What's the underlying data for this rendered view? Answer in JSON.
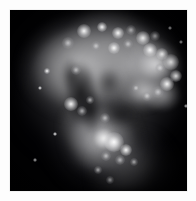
{
  "page": {
    "background_color": "#fdfdfd",
    "width": 196,
    "height": 201,
    "caption": ""
  },
  "plate": {
    "name": "colliding-galaxies-grayscale-plate",
    "alt_text": "Grayscale astronomical image of a pair of colliding interacting galaxies",
    "frame": {
      "left": 10,
      "top": 10,
      "width": 177,
      "height": 181
    },
    "background_color": "#010103",
    "colors": {
      "sky_background": "#010103",
      "faint_halo": "#5a5a5d",
      "mid_nebulosity": "#96969a",
      "bright_body": "#c4c4c6",
      "brightest_knot": "#fafafa",
      "dust_lane": "#040406",
      "page_white": "#fdfdfd"
    },
    "regions": [
      {
        "label": "northern-galaxy-body",
        "description": "large bright lobe filling the upper half"
      },
      {
        "label": "northern-galaxy-arc",
        "description": "bright rim of knots along the upper-right edge"
      },
      {
        "label": "dust-lane",
        "description": "dark absorbing lane through the centre-left"
      },
      {
        "label": "southern-galaxy-body",
        "description": "lower lobe with a compact bright nucleus"
      },
      {
        "label": "southern-tidal-tail",
        "description": "faint plume sweeping toward the lower right"
      },
      {
        "label": "vignette",
        "description": "deep black sky in the corners"
      }
    ],
    "knots": [
      {
        "x": 74,
        "y": 21,
        "r": 3.0,
        "bright": true
      },
      {
        "x": 92,
        "y": 17,
        "r": 2.4,
        "bright": true
      },
      {
        "x": 108,
        "y": 23,
        "r": 2.6,
        "bright": true
      },
      {
        "x": 121,
        "y": 20,
        "r": 2.2,
        "bright": false
      },
      {
        "x": 133,
        "y": 28,
        "r": 3.2,
        "bright": true
      },
      {
        "x": 145,
        "y": 26,
        "r": 2.4,
        "bright": false
      },
      {
        "x": 58,
        "y": 33,
        "r": 2.6,
        "bright": false
      },
      {
        "x": 86,
        "y": 36,
        "r": 2.2,
        "bright": false
      },
      {
        "x": 104,
        "y": 38,
        "r": 2.8,
        "bright": true
      },
      {
        "x": 118,
        "y": 34,
        "r": 2.4,
        "bright": false
      },
      {
        "x": 140,
        "y": 40,
        "r": 3.4,
        "bright": true
      },
      {
        "x": 152,
        "y": 44,
        "r": 2.6,
        "bright": true
      },
      {
        "x": 161,
        "y": 52,
        "r": 3.6,
        "bright": true
      },
      {
        "x": 150,
        "y": 58,
        "r": 2.4,
        "bright": false
      },
      {
        "x": 166,
        "y": 66,
        "r": 2.8,
        "bright": true
      },
      {
        "x": 157,
        "y": 74,
        "r": 3.0,
        "bright": true
      },
      {
        "x": 148,
        "y": 82,
        "r": 2.6,
        "bright": false
      },
      {
        "x": 137,
        "y": 86,
        "r": 2.2,
        "bright": false
      },
      {
        "x": 126,
        "y": 78,
        "r": 2.0,
        "bright": false
      },
      {
        "x": 66,
        "y": 60,
        "r": 2.2,
        "bright": false
      },
      {
        "x": 61,
        "y": 94,
        "r": 3.0,
        "bright": true
      },
      {
        "x": 72,
        "y": 101,
        "r": 2.4,
        "bright": false
      },
      {
        "x": 80,
        "y": 90,
        "r": 2.0,
        "bright": false
      },
      {
        "x": 95,
        "y": 108,
        "r": 2.2,
        "bright": false
      },
      {
        "x": 104,
        "y": 132,
        "r": 4.6,
        "bright": true
      },
      {
        "x": 116,
        "y": 140,
        "r": 2.8,
        "bright": true
      },
      {
        "x": 110,
        "y": 150,
        "r": 2.4,
        "bright": false
      },
      {
        "x": 96,
        "y": 146,
        "r": 2.2,
        "bright": false
      },
      {
        "x": 124,
        "y": 152,
        "r": 2.0,
        "bright": false
      },
      {
        "x": 88,
        "y": 160,
        "r": 2.0,
        "bright": false
      },
      {
        "x": 100,
        "y": 170,
        "r": 1.8,
        "bright": false
      }
    ],
    "stars": [
      {
        "x": 37,
        "y": 61,
        "r": 1.5
      },
      {
        "x": 30,
        "y": 78,
        "r": 1.1
      },
      {
        "x": 171,
        "y": 32,
        "r": 1.2
      },
      {
        "x": 176,
        "y": 96,
        "r": 1.0
      },
      {
        "x": 45,
        "y": 124,
        "r": 1.0
      },
      {
        "x": 160,
        "y": 18,
        "r": 1.0
      },
      {
        "x": 25,
        "y": 150,
        "r": 0.9
      }
    ]
  }
}
